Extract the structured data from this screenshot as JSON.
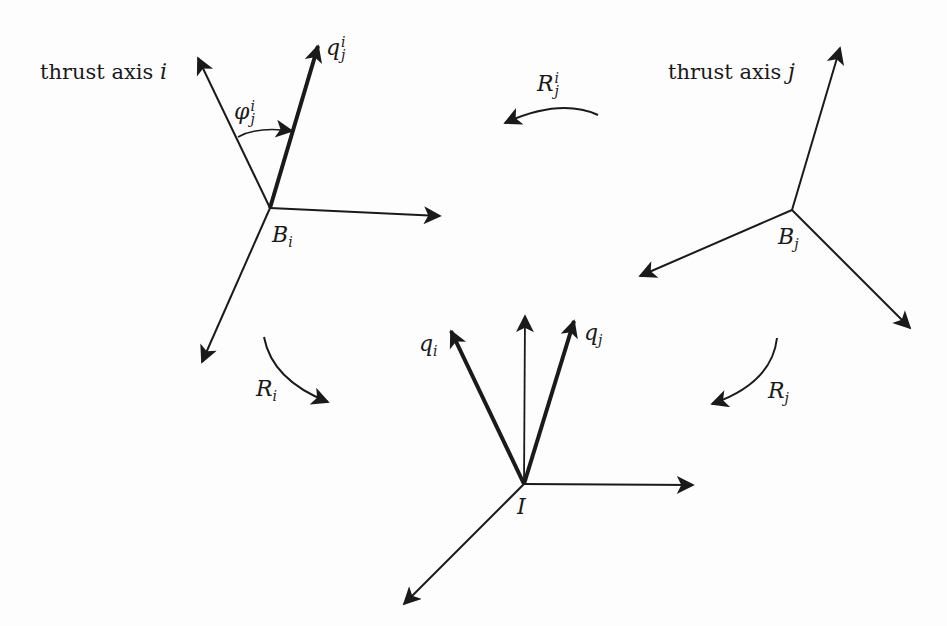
{
  "diagram": {
    "colors": {
      "stroke": "#1a1a1a",
      "background": "#fdfdfd"
    },
    "frames": {
      "Bi": {
        "name": "B",
        "sub": "i",
        "origin": [
          270,
          208
        ]
      },
      "Bj": {
        "name": "B",
        "sub": "j",
        "origin": [
          792,
          210
        ]
      },
      "I": {
        "name": "I",
        "origin": [
          524,
          484
        ]
      }
    },
    "labels": {
      "thrust_axis_i": {
        "text": "thrust axis ",
        "var": "i"
      },
      "thrust_axis_j": {
        "text": "thrust axis ",
        "var": "j"
      },
      "q_j_i": {
        "base": "q",
        "sup": "i",
        "sub": "j"
      },
      "phi_j_i": {
        "base": "φ",
        "sup": "i",
        "sub": "j"
      },
      "R_j_i": {
        "base": "R",
        "sup": "i",
        "sub": "j"
      },
      "R_i": {
        "base": "R",
        "sub": "i"
      },
      "R_j": {
        "base": "R",
        "sub": "j"
      },
      "q_i": {
        "base": "q",
        "sub": "i"
      },
      "q_j": {
        "base": "q",
        "sub": "j"
      }
    }
  }
}
